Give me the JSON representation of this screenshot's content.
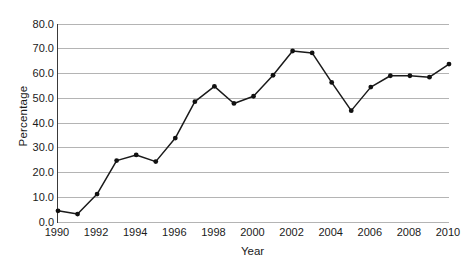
{
  "chart_data": {
    "type": "line",
    "title": "",
    "xlabel": "Year",
    "ylabel": "Percentage",
    "x": [
      1990,
      1991,
      1992,
      1993,
      1994,
      1995,
      1996,
      1997,
      1998,
      1999,
      2000,
      2001,
      2002,
      2003,
      2004,
      2005,
      2006,
      2007,
      2008,
      2009,
      2010
    ],
    "values": [
      4.5,
      3.2,
      11.3,
      24.8,
      27.1,
      24.4,
      33.9,
      48.6,
      54.8,
      47.9,
      50.8,
      59.3,
      69.1,
      68.3,
      56.4,
      45.0,
      54.5,
      59.1,
      59.1,
      58.5,
      63.8
    ],
    "series": [
      {
        "name": "Percentage",
        "values": [
          4.5,
          3.2,
          11.3,
          24.8,
          27.1,
          24.4,
          33.9,
          48.6,
          54.8,
          47.9,
          50.8,
          59.3,
          69.1,
          68.3,
          56.4,
          45.0,
          54.5,
          59.1,
          59.1,
          58.5,
          63.8
        ]
      }
    ],
    "xlim": [
      1990,
      2010
    ],
    "ylim": [
      0,
      80
    ],
    "y_ticks": [
      0,
      10,
      20,
      30,
      40,
      50,
      60,
      70,
      80
    ],
    "y_tick_labels": [
      "0.0",
      "10.0",
      "20.0",
      "30.0",
      "40.0",
      "50.0",
      "60.0",
      "70.0",
      "80.0"
    ],
    "x_ticks": [
      1990,
      1992,
      1994,
      1996,
      1998,
      2000,
      2002,
      2004,
      2006,
      2008,
      2010
    ],
    "x_tick_labels": [
      "1990",
      "1992",
      "1994",
      "1996",
      "1998",
      "2000",
      "2002",
      "2004",
      "2006",
      "2008",
      "2010"
    ],
    "x_minor_ticks": [
      1991,
      1993,
      1995,
      1997,
      1999,
      2001,
      2003,
      2005,
      2007,
      2009
    ],
    "grid": "horizontal",
    "legend": "none",
    "marker": "filled-circle",
    "colors": {
      "line": "#1a1a1a",
      "marker": "#111111",
      "gridline": "#b4b4b4",
      "axis": "#3a3a3a",
      "background": "#ffffff",
      "text": "#1a1a1a"
    }
  }
}
